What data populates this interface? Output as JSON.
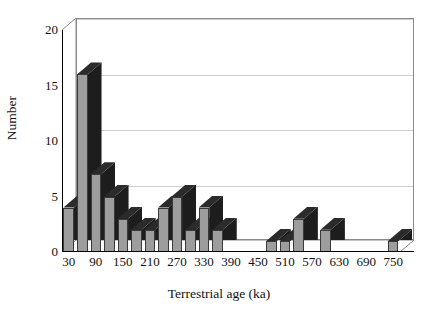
{
  "chart_data": {
    "type": "bar",
    "title": "",
    "xlabel": "Terrestrial age (ka)",
    "ylabel": "Number",
    "grid": true,
    "legend": "none",
    "style": "3d-column-histogram",
    "xlim": [
      0,
      780
    ],
    "ylim": [
      0,
      20
    ],
    "yticks": [
      0,
      5,
      10,
      15,
      20
    ],
    "xticks": [
      30,
      90,
      150,
      210,
      270,
      330,
      390,
      450,
      510,
      570,
      630,
      690,
      750
    ],
    "bin_width": 30,
    "categories": [
      30,
      60,
      90,
      120,
      150,
      180,
      210,
      240,
      270,
      300,
      330,
      360,
      390,
      420,
      450,
      480,
      510,
      540,
      570,
      600,
      630,
      660,
      690,
      720,
      750
    ],
    "values": [
      4,
      16,
      7,
      5,
      3,
      2,
      2,
      4,
      5,
      2,
      4,
      2,
      0,
      0,
      0,
      1,
      1,
      3,
      0,
      2,
      0,
      0,
      0,
      0,
      1
    ],
    "colors": {
      "bar_face": "#9d9d9d",
      "bar_side": "#1d1d1d",
      "bar_top": "#2b2b2b",
      "gridline": "#cfcfcf",
      "axis": "#000000",
      "background": "#ffffff"
    }
  },
  "axes": {
    "y_tick_labels": [
      "0",
      "5",
      "10",
      "15",
      "20"
    ],
    "x_tick_labels": [
      "30",
      "90",
      "150",
      "210",
      "270",
      "330",
      "390",
      "450",
      "510",
      "570",
      "630",
      "690",
      "750"
    ],
    "x_title": "Terrestrial age (ka)",
    "y_title": "Number"
  }
}
